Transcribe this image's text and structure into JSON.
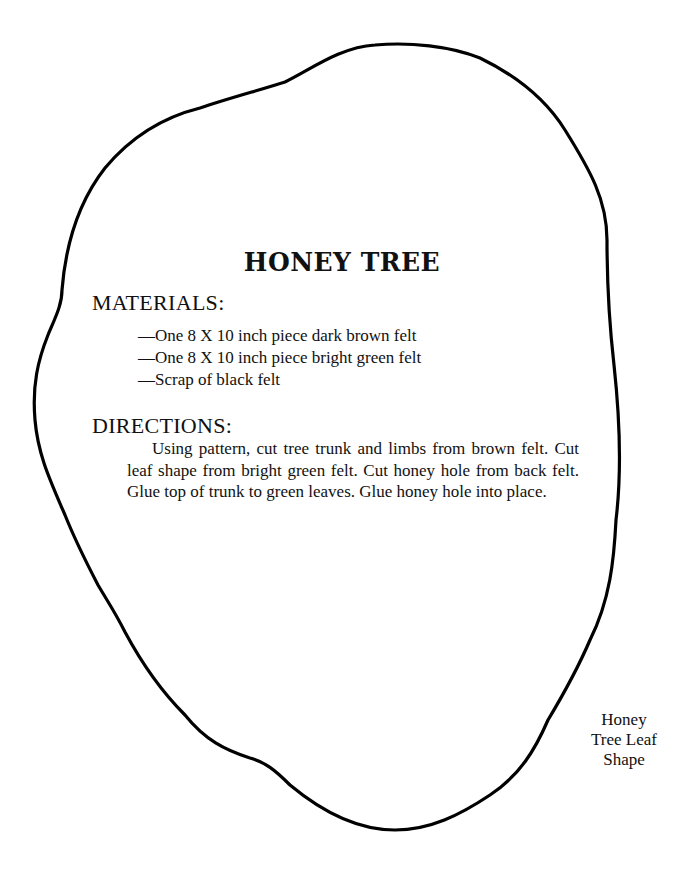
{
  "document": {
    "title": "HONEY TREE",
    "materials": {
      "heading": "MATERIALS:",
      "items": [
        "—One 8 X 10 inch piece dark brown felt",
        "—One 8 X 10 inch piece bright green felt",
        "—Scrap of black felt"
      ]
    },
    "directions": {
      "heading": "DIRECTIONS:",
      "text": "Using pattern, cut tree trunk and limbs from brown felt. Cut leaf shape from bright green felt. Cut honey hole from back felt. Glue top of trunk to green leaves. Glue honey hole into place."
    },
    "pattern": {
      "label_lines": [
        "Honey",
        "Tree Leaf",
        "Shape"
      ],
      "outline_color": "#000000"
    }
  }
}
